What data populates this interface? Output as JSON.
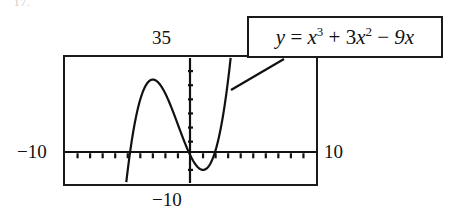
{
  "figure": {
    "artifact_text": "17.",
    "equation": {
      "lhs": "y",
      "equals": "=",
      "term1_base": "x",
      "term1_exp": "3",
      "op1": "+",
      "term2_coef": "3",
      "term2_base": "x",
      "term2_exp": "2",
      "op2": "−",
      "term3": "9x",
      "plain": "y = x³ + 3x² − 9x"
    },
    "labels": {
      "y_max": "35",
      "y_min": "−10",
      "x_min": "−10",
      "x_max": "10"
    },
    "colors": {
      "ink": "#1a1a1a",
      "background": "#ffffff",
      "curve": "#111111"
    }
  },
  "chart_data": {
    "type": "line",
    "title": "",
    "subtitle": "",
    "xlabel": "",
    "ylabel": "",
    "function": "y = x^3 + 3x^2 - 9x",
    "xlim": [
      -10,
      10
    ],
    "ylim": [
      -10,
      35
    ],
    "grid": false,
    "legend": false,
    "annotations": [
      {
        "text": "y = x³ + 3x² − 9x",
        "kind": "callout-box",
        "points_to": "curve"
      }
    ],
    "axis_ticks": {
      "x": [
        -9,
        -8,
        -7,
        -6,
        -5,
        -4,
        -3,
        -2,
        -1,
        1,
        2,
        3,
        4,
        5,
        6,
        7,
        8,
        9
      ],
      "y": [
        -5,
        5,
        10,
        15,
        20,
        25,
        30
      ]
    },
    "tick_labels": {
      "x_left_edge": "−10",
      "x_right_edge": "10",
      "y_top_edge": "35",
      "y_bottom_edge": "−10"
    },
    "key_points": {
      "local_maximum": [
        -2.73,
        15.49
      ],
      "local_minimum": [
        1.1,
        -5.05
      ],
      "x_intercepts": [
        -4.85,
        0,
        1.85
      ],
      "y_intercept": [
        0,
        0
      ]
    },
    "x": [
      -5.0,
      -4.8,
      -4.6,
      -4.4,
      -4.2,
      -4.0,
      -3.8,
      -3.6,
      -3.4,
      -3.2,
      -3.0,
      -2.8,
      -2.6,
      -2.4,
      -2.2,
      -2.0,
      -1.8,
      -1.6,
      -1.4,
      -1.2,
      -1.0,
      -0.8,
      -0.6,
      -0.4,
      -0.2,
      0.0,
      0.2,
      0.4,
      0.6,
      0.8,
      1.0,
      1.2,
      1.4,
      1.6,
      1.8,
      2.0,
      2.2,
      2.4,
      2.6,
      2.8,
      3.0
    ],
    "y": [
      -5.0,
      0.29,
      5.06,
      9.34,
      13.18,
      17.0,
      19.06,
      21.74,
      24.05,
      26.01,
      27.0,
      27.55,
      27.8,
      27.79,
      27.56,
      26.0,
      24.89,
      23.46,
      21.78,
      19.9,
      11.0,
      9.06,
      7.06,
      5.02,
      2.97,
      0.0,
      -1.67,
      -3.06,
      -4.1,
      -4.77,
      -5.0,
      -4.75,
      -3.98,
      -2.63,
      -0.65,
      2.0,
      5.4,
      9.5,
      14.36,
      20.06,
      27.0
    ]
  }
}
